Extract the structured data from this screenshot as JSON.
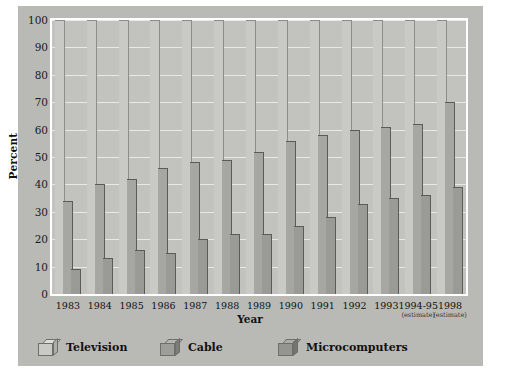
{
  "chart_data": {
    "type": "bar",
    "title": "",
    "xlabel": "Year",
    "ylabel": "Percent",
    "ylim": [
      0,
      100
    ],
    "yticks": [
      0,
      10,
      20,
      30,
      40,
      50,
      60,
      70,
      80,
      90,
      100
    ],
    "grid": true,
    "legend_position": "bottom",
    "categories": [
      "1983",
      "1984",
      "1985",
      "1986",
      "1987",
      "1988",
      "1989",
      "1990",
      "1991",
      "1992",
      "1993",
      "1994-95",
      "1998"
    ],
    "category_notes": [
      "",
      "",
      "",
      "",
      "",
      "",
      "",
      "",
      "",
      "",
      "",
      "(estimate)",
      "(estimate)"
    ],
    "series": [
      {
        "name": "Television",
        "values": [
          100,
          100,
          100,
          100,
          100,
          100,
          100,
          100,
          100,
          100,
          100,
          100,
          100
        ]
      },
      {
        "name": "Cable",
        "values": [
          34,
          40,
          42,
          46,
          48,
          49,
          52,
          56,
          58,
          60,
          61,
          62,
          70
        ]
      },
      {
        "name": "Microcomputers",
        "values": [
          9,
          13,
          16,
          15,
          20,
          22,
          22,
          25,
          28,
          33,
          35,
          36,
          39
        ]
      }
    ],
    "series_colors": [
      "#c9c9c5",
      "#a6a6a2",
      "#9a9a96"
    ]
  },
  "axes": {
    "y_title": "Percent",
    "x_title": "Year",
    "y_tick_labels": [
      "100",
      "90",
      "80",
      "70",
      "60",
      "50",
      "40",
      "30",
      "20",
      "10",
      "0"
    ]
  },
  "legend": {
    "items": [
      {
        "label": "Television"
      },
      {
        "label": "Cable"
      },
      {
        "label": "Microcomputers"
      }
    ]
  },
  "colors": {
    "card_background": "#b9b9b6",
    "plot_background": "#c2c2bf",
    "gridline": "#e8e8e4",
    "frame": "#ffffff",
    "text": "#111111"
  }
}
